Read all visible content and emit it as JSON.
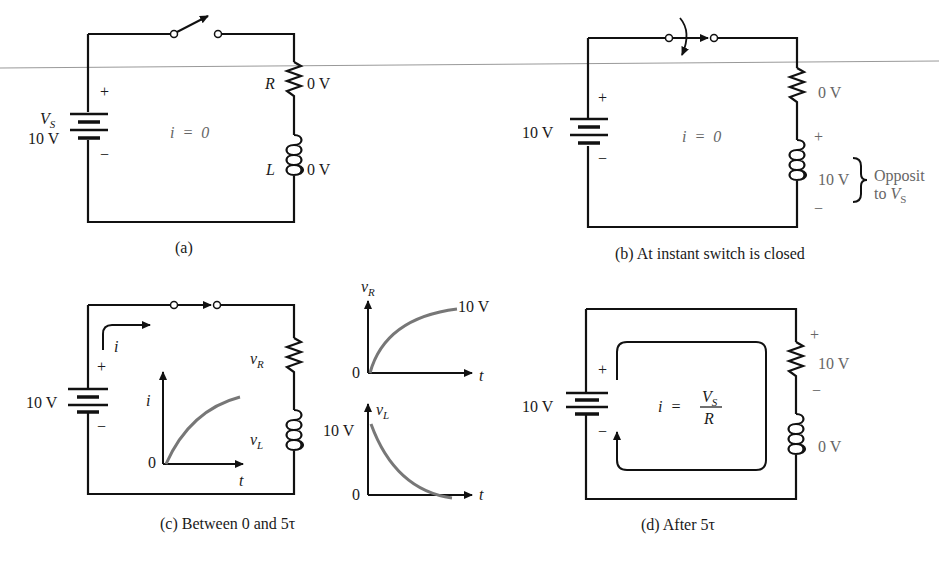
{
  "figure": {
    "panels": [
      {
        "id": "a",
        "caption": "(a)",
        "source_label": "V",
        "source_sub": "S",
        "source_value": "10 V",
        "plus": "+",
        "minus": "−",
        "current": "i  =  0",
        "resistor_label": "R",
        "resistor_voltage": "0 V",
        "inductor_label": "L",
        "inductor_voltage": "0 V",
        "switch_state": "open"
      },
      {
        "id": "b",
        "caption": "(b) At instant switch is closed",
        "source_value": "10 V",
        "plus": "+",
        "minus": "−",
        "current": "i  =  0",
        "resistor_voltage": "0 V",
        "inductor_plus": "+",
        "inductor_minus": "−",
        "inductor_voltage": "10 V",
        "annotation_line1": "Opposit",
        "annotation_line2_prefix": "to ",
        "annotation_line2_var": "V",
        "annotation_line2_sub": "S",
        "switch_state": "closing"
      },
      {
        "id": "c",
        "caption": "(c) Between 0 and 5τ",
        "source_value": "10 V",
        "plus": "+",
        "minus": "−",
        "current_label": "i",
        "resistor_label": "v",
        "resistor_sub": "R",
        "inductor_label": "v",
        "inductor_sub": "L",
        "switch_state": "closed",
        "inset_graph": {
          "y_label": "i",
          "x_label": "t",
          "origin": "0"
        }
      },
      {
        "id": "d",
        "caption": "(d) After 5τ",
        "source_value": "10 V",
        "plus": "+",
        "minus": "−",
        "current_lhs": "i  =",
        "current_num": "V",
        "current_num_sub": "S",
        "current_den": "R",
        "resistor_plus": "+",
        "resistor_voltage": "10 V",
        "resistor_minus": "−",
        "inductor_voltage": "0 V",
        "switch_state": "none"
      }
    ],
    "side_graphs": [
      {
        "y_label": "v",
        "y_sub": "R",
        "x_label": "t",
        "origin": "0",
        "end_value": "10 V",
        "shape": "rising"
      },
      {
        "y_label": "v",
        "y_sub": "L",
        "x_label": "t",
        "origin": "0",
        "start_value": "10 V",
        "shape": "decaying"
      }
    ]
  }
}
